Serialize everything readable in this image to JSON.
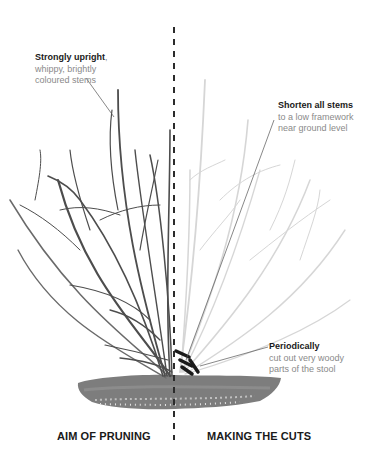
{
  "diagram": {
    "type": "pruning-illustration",
    "divider": {
      "style": "dashed",
      "color": "#2b2b2b"
    },
    "colors": {
      "old_stems": "#4a4a4a",
      "new_stems": "#d4d4d4",
      "cut_marks": "#1a1a1a",
      "soil": "#7a7a7a",
      "label_bold": "#1a1a1a",
      "label_body": "#8a8a8a"
    }
  },
  "annotations": {
    "upright": {
      "title": "Strongly upright",
      "suffix": ",",
      "line1": "whippy, brightly",
      "line2": "coloured stems"
    },
    "shorten": {
      "title": "Shorten all stems",
      "line1": "to a low framework",
      "line2": "near ground level"
    },
    "periodically": {
      "title": "Periodically",
      "line1": "cut out very woody",
      "line2": "parts of the stool"
    }
  },
  "sections": {
    "left": "AIM OF PRUNING",
    "right": "MAKING THE CUTS"
  }
}
